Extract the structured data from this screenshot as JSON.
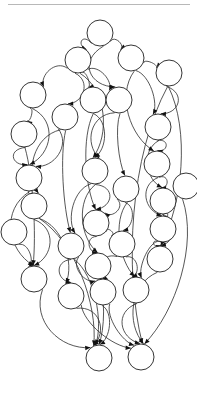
{
  "figure": {
    "kind": "directed-acyclic-graph",
    "title": "",
    "background_color": "#ffffff",
    "node_fill_color": "#ffffff",
    "node_stroke_color": "#1f1f1f",
    "edge_color": "#2b2b2b",
    "arrow_color": "#111111",
    "rule_color": "#9a9a9a",
    "node_radius": 13,
    "node_count": 30,
    "edge_count": 62,
    "canvas": {
      "width": 197,
      "height": 393
    },
    "top_rule": {
      "x1": 8,
      "y1": 4,
      "x2": 190,
      "y2": 5
    }
  },
  "chart_data": {
    "type": "diagram",
    "title": "",
    "xlabel": "",
    "ylabel": "",
    "nodes": [
      {
        "id": "n0",
        "label": "",
        "x": 100,
        "y": 33,
        "r": 13
      },
      {
        "id": "n1",
        "label": "",
        "x": 78,
        "y": 60,
        "r": 13
      },
      {
        "id": "n2",
        "label": "",
        "x": 131,
        "y": 58,
        "r": 13
      },
      {
        "id": "n3",
        "label": "",
        "x": 169,
        "y": 73,
        "r": 13
      },
      {
        "id": "n4",
        "label": "",
        "x": 33,
        "y": 95,
        "r": 13
      },
      {
        "id": "n5",
        "label": "",
        "x": 93,
        "y": 100,
        "r": 13
      },
      {
        "id": "n6",
        "label": "",
        "x": 119,
        "y": 100,
        "r": 13
      },
      {
        "id": "n7",
        "label": "",
        "x": 65,
        "y": 117,
        "r": 13
      },
      {
        "id": "n8",
        "label": "",
        "x": 24,
        "y": 134,
        "r": 13
      },
      {
        "id": "n9",
        "label": "",
        "x": 158,
        "y": 127,
        "r": 13
      },
      {
        "id": "n10",
        "label": "",
        "x": 157,
        "y": 164,
        "r": 13
      },
      {
        "id": "n11",
        "label": "",
        "x": 29,
        "y": 178,
        "r": 13
      },
      {
        "id": "n12",
        "label": "",
        "x": 95,
        "y": 171,
        "r": 13
      },
      {
        "id": "n13",
        "label": "",
        "x": 34,
        "y": 206,
        "r": 13
      },
      {
        "id": "n14",
        "label": "",
        "x": 126,
        "y": 189,
        "r": 13
      },
      {
        "id": "n15",
        "label": "",
        "x": 163,
        "y": 201,
        "r": 13
      },
      {
        "id": "n16",
        "label": "",
        "x": 96,
        "y": 223,
        "r": 13
      },
      {
        "id": "n17",
        "label": "",
        "x": 163,
        "y": 229,
        "r": 13
      },
      {
        "id": "n18",
        "label": "",
        "x": 122,
        "y": 244,
        "r": 13
      },
      {
        "id": "n19",
        "label": "",
        "x": 71,
        "y": 246,
        "r": 13
      },
      {
        "id": "n20",
        "label": "",
        "x": 160,
        "y": 259,
        "r": 13
      },
      {
        "id": "n21",
        "label": "",
        "x": 98,
        "y": 266,
        "r": 13
      },
      {
        "id": "n22",
        "label": "",
        "x": 34,
        "y": 279,
        "r": 13
      },
      {
        "id": "n23",
        "label": "",
        "x": 71,
        "y": 296,
        "r": 13
      },
      {
        "id": "n24",
        "label": "",
        "x": 136,
        "y": 290,
        "r": 13
      },
      {
        "id": "n25",
        "label": "",
        "x": 103,
        "y": 292,
        "r": 13
      },
      {
        "id": "n26",
        "label": "",
        "x": 99,
        "y": 358,
        "r": 13
      },
      {
        "id": "n27",
        "label": "",
        "x": 141,
        "y": 357,
        "r": 13
      },
      {
        "id": "n28",
        "label": "",
        "x": 14,
        "y": 232,
        "r": 13
      },
      {
        "id": "n29",
        "label": "",
        "x": 186,
        "y": 186,
        "r": 13
      }
    ],
    "edges": [
      {
        "from": "n0",
        "to": "n1"
      },
      {
        "from": "n0",
        "to": "n2"
      },
      {
        "from": "n0",
        "to": "n6"
      },
      {
        "from": "n2",
        "to": "n3"
      },
      {
        "from": "n2",
        "to": "n9"
      },
      {
        "from": "n2",
        "to": "n10"
      },
      {
        "from": "n1",
        "to": "n4"
      },
      {
        "from": "n1",
        "to": "n5"
      },
      {
        "from": "n1",
        "to": "n6"
      },
      {
        "from": "n1",
        "to": "n7"
      },
      {
        "from": "n1",
        "to": "n12"
      },
      {
        "from": "n3",
        "to": "n9"
      },
      {
        "from": "n3",
        "to": "n20"
      },
      {
        "from": "n4",
        "to": "n8"
      },
      {
        "from": "n4",
        "to": "n11"
      },
      {
        "from": "n5",
        "to": "n12"
      },
      {
        "from": "n5",
        "to": "n16"
      },
      {
        "from": "n6",
        "to": "n14"
      },
      {
        "from": "n6",
        "to": "n12"
      },
      {
        "from": "n7",
        "to": "n11"
      },
      {
        "from": "n7",
        "to": "n13"
      },
      {
        "from": "n7",
        "to": "n19"
      },
      {
        "from": "n8",
        "to": "n11"
      },
      {
        "from": "n8",
        "to": "n22"
      },
      {
        "from": "n9",
        "to": "n10"
      },
      {
        "from": "n9",
        "to": "n15"
      },
      {
        "from": "n10",
        "to": "n15"
      },
      {
        "from": "n10",
        "to": "n17"
      },
      {
        "from": "n11",
        "to": "n13"
      },
      {
        "from": "n11",
        "to": "n22"
      },
      {
        "from": "n12",
        "to": "n16"
      },
      {
        "from": "n12",
        "to": "n19"
      },
      {
        "from": "n12",
        "to": "n21"
      },
      {
        "from": "n13",
        "to": "n22"
      },
      {
        "from": "n13",
        "to": "n23"
      },
      {
        "from": "n14",
        "to": "n18"
      },
      {
        "from": "n14",
        "to": "n16"
      },
      {
        "from": "n14",
        "to": "n24"
      },
      {
        "from": "n15",
        "to": "n17"
      },
      {
        "from": "n15",
        "to": "n20"
      },
      {
        "from": "n16",
        "to": "n18"
      },
      {
        "from": "n16",
        "to": "n21"
      },
      {
        "from": "n17",
        "to": "n20"
      },
      {
        "from": "n17",
        "to": "n24"
      },
      {
        "from": "n18",
        "to": "n25"
      },
      {
        "from": "n18",
        "to": "n24"
      },
      {
        "from": "n19",
        "to": "n23"
      },
      {
        "from": "n19",
        "to": "n25"
      },
      {
        "from": "n20",
        "to": "n27"
      },
      {
        "from": "n21",
        "to": "n25"
      },
      {
        "from": "n21",
        "to": "n26"
      },
      {
        "from": "n22",
        "to": "n26"
      },
      {
        "from": "n23",
        "to": "n26"
      },
      {
        "from": "n23",
        "to": "n27"
      },
      {
        "from": "n24",
        "to": "n27"
      },
      {
        "from": "n25",
        "to": "n26"
      },
      {
        "from": "n25",
        "to": "n27"
      },
      {
        "from": "n19",
        "to": "n26"
      },
      {
        "from": "n13",
        "to": "n26"
      },
      {
        "from": "n29",
        "to": "n27"
      },
      {
        "from": "n28",
        "to": "n22"
      },
      {
        "from": "n3",
        "to": "n27"
      }
    ]
  }
}
